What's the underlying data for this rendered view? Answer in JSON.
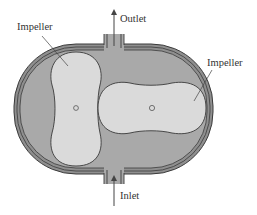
{
  "diagram": {
    "type": "rotary lobe pump cross-section",
    "labels": {
      "outlet": "Outlet",
      "inlet": "Inlet",
      "impeller_left": "Impeller",
      "impeller_right": "Impeller"
    },
    "colors": {
      "housing_shell": "#8a8a8a",
      "cavity": "#a9a9a9",
      "impeller_fill": "#d9d9d9",
      "outline": "#3a3a3a",
      "text": "#333333"
    }
  }
}
